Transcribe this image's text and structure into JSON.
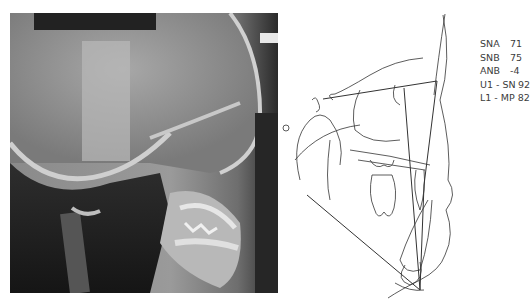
{
  "figure": {
    "xray_alt": "Lateral cephalometric radiograph",
    "tracing_alt": "Cephalometric tracing"
  },
  "measurements": [
    {
      "label": "SNA",
      "value": "71"
    },
    {
      "label": "SNB",
      "value": "75"
    },
    {
      "label": "ANB",
      "value": "-4"
    },
    {
      "label": "U1 - SN",
      "value": "92"
    },
    {
      "label": "L1 - MP",
      "value": "82"
    }
  ],
  "colors": {
    "tracing_line": "#333333",
    "label_text": "#3c3c3c",
    "xray_dark": "#1e1e1e",
    "xray_light": "#d8d8d8"
  }
}
